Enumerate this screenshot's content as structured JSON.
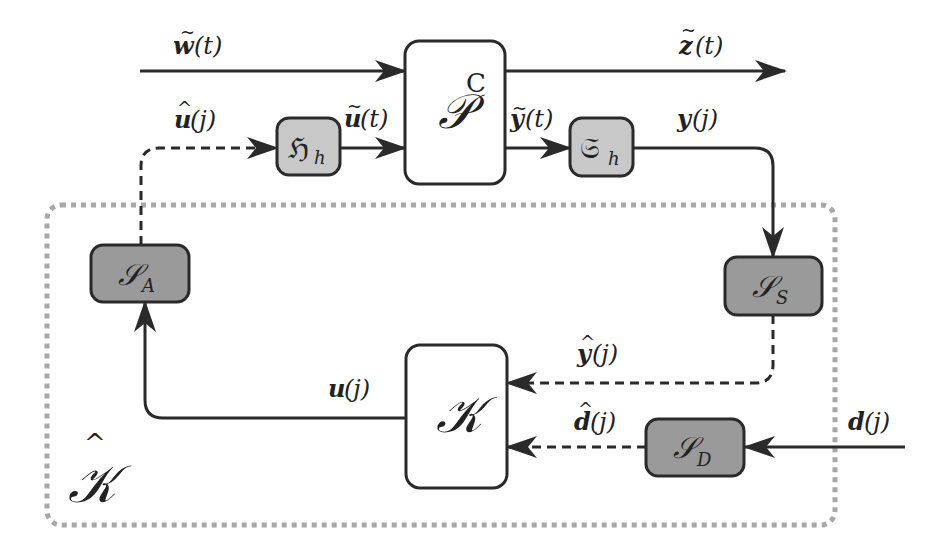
{
  "diagram": {
    "type": "block-diagram",
    "colors": {
      "line": "#2a2a2a",
      "block_fill_white": "#ffffff",
      "block_fill_light": "#c8c8c8",
      "block_fill_dark": "#9a9a9a",
      "region_border": "#a8a8a8"
    },
    "blocks": {
      "plant": {
        "main": "𝒫",
        "sup": "C"
      },
      "hold": {
        "main": "ℌ",
        "sub": "h"
      },
      "sampler": {
        "main": "𝔖",
        "sub": "h"
      },
      "actuator": {
        "main": "𝒮",
        "sub": "A"
      },
      "sensor": {
        "main": "𝒮",
        "sub": "S"
      },
      "disturbance_sensor": {
        "main": "𝒮",
        "sub": "D"
      },
      "controller": {
        "main": "𝒦"
      }
    },
    "region_label": {
      "main": "𝒦",
      "hat": "^"
    },
    "signals": {
      "w_tilde": {
        "sym": "w",
        "mark": "~",
        "arg": "(t)"
      },
      "z_tilde": {
        "sym": "z",
        "mark": "~",
        "arg": "(t)"
      },
      "u_hat": {
        "sym": "u",
        "mark": "^",
        "arg": "(j)"
      },
      "u_tilde": {
        "sym": "u",
        "mark": "~",
        "arg": "(t)"
      },
      "y_tilde": {
        "sym": "y",
        "mark": "~",
        "arg": "(t)"
      },
      "y": {
        "sym": "y",
        "arg": "(j)"
      },
      "y_hat": {
        "sym": "y",
        "mark": "^",
        "arg": "(j)"
      },
      "u": {
        "sym": "u",
        "arg": "(j)"
      },
      "d_hat": {
        "sym": "d",
        "mark": "^",
        "arg": "(j)"
      },
      "d": {
        "sym": "d",
        "arg": "(j)"
      }
    },
    "connections": [
      {
        "from": "w_tilde (input)",
        "to": "plant",
        "style": "solid"
      },
      {
        "from": "plant",
        "to": "z_tilde (output)",
        "style": "solid"
      },
      {
        "from": "hold",
        "to": "plant",
        "signal": "u_tilde",
        "style": "solid"
      },
      {
        "from": "plant",
        "to": "sampler",
        "signal": "y_tilde",
        "style": "solid"
      },
      {
        "from": "sampler",
        "to": "sensor",
        "signal": "y",
        "style": "solid"
      },
      {
        "from": "sensor",
        "to": "controller",
        "signal": "y_hat",
        "style": "dashed"
      },
      {
        "from": "d (input)",
        "to": "disturbance_sensor",
        "style": "solid"
      },
      {
        "from": "disturbance_sensor",
        "to": "controller",
        "signal": "d_hat",
        "style": "dashed"
      },
      {
        "from": "controller",
        "to": "actuator",
        "signal": "u",
        "style": "solid"
      },
      {
        "from": "actuator",
        "to": "hold",
        "signal": "u_hat",
        "style": "dashed"
      }
    ]
  }
}
